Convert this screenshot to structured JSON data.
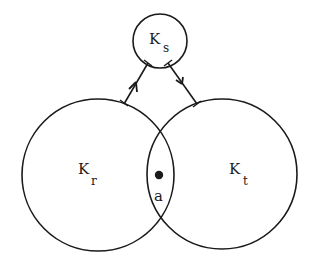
{
  "diagram": {
    "nodes": {
      "ks": {
        "label": "K",
        "subscript": "s",
        "cx": 160,
        "cy": 41,
        "r": 27
      },
      "kr": {
        "label": "K",
        "subscript": "r",
        "cx": 98,
        "cy": 175,
        "r": 76
      },
      "kt": {
        "label": "K",
        "subscript": "t",
        "cx": 222,
        "cy": 174,
        "r": 75
      }
    },
    "point": {
      "label": "a",
      "cx": 159,
      "cy": 175
    },
    "arrows": [
      {
        "from": "kr",
        "to": "ks",
        "direction": "up"
      },
      {
        "from": "ks",
        "to": "kt",
        "direction": "down"
      }
    ],
    "colors": {
      "stroke": "#1a1a1a",
      "background": "#ffffff"
    }
  }
}
